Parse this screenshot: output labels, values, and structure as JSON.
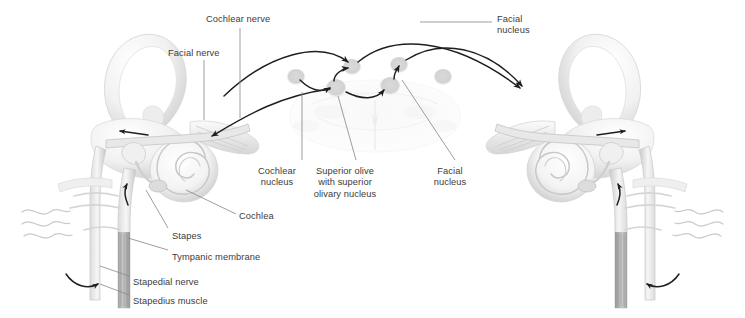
{
  "figure": {
    "background_color": "#ffffff",
    "text_color": "#3b3b3b",
    "leader_line_color": "#8c8c8c",
    "arrow_color": "#1e1e1e",
    "nucleus_node_color": "#d2d2d2",
    "width": 745,
    "height": 318
  },
  "labels": [
    {
      "id": "cochlear-nerve",
      "text": "Cochlear nerve",
      "x": 206,
      "y": 14,
      "align": "left"
    },
    {
      "id": "facial-nerve",
      "text": "Facial nerve",
      "x": 168,
      "y": 48,
      "align": "left"
    },
    {
      "id": "facial-nucleus-top",
      "text": "Facial\nnucleus",
      "x": 497,
      "y": 14,
      "align": "left"
    },
    {
      "id": "cochlear-nucleus",
      "text": "Cochlear\nnucleus",
      "x": 277,
      "y": 166,
      "align": "center"
    },
    {
      "id": "superior-olive",
      "text": "Superior olive\nwith superior\nolivary nucleus",
      "x": 345,
      "y": 166,
      "align": "center"
    },
    {
      "id": "facial-nucleus-mid",
      "text": "Facial\nnucleus",
      "x": 450,
      "y": 166,
      "align": "center"
    },
    {
      "id": "cochlea",
      "text": "Cochlea",
      "x": 239,
      "y": 211,
      "align": "left"
    },
    {
      "id": "stapes",
      "text": "Stapes",
      "x": 172,
      "y": 231,
      "align": "left"
    },
    {
      "id": "tympanic-membrane",
      "text": "Tympanic membrane",
      "x": 172,
      "y": 252,
      "align": "left"
    },
    {
      "id": "stapedial-nerve",
      "text": "Stapedial nerve",
      "x": 133,
      "y": 277,
      "align": "left"
    },
    {
      "id": "stapedius-muscle",
      "text": "Stapedius muscle",
      "x": 133,
      "y": 296,
      "align": "left"
    }
  ],
  "anatomy": {
    "left_ear": "left ear: auricle loop, ossicles, tympanic membrane, cochlear spiral, facial and cochlear nerve trunks, stapedius muscle",
    "right_ear": "right ear: mirrored auricle loop, ossicles, tympanic membrane, cochlear spiral, nerve trunks, stapedius muscle",
    "brainstem": "faint axial brainstem cross-section at center"
  },
  "nuclei_nodes": [
    {
      "id": "left-cochlear-nucleus",
      "x": 336,
      "y": 88
    },
    {
      "id": "left-superior-olive",
      "x": 352,
      "y": 67
    },
    {
      "id": "right-superior-olive",
      "x": 399,
      "y": 65
    },
    {
      "id": "right-facial-nucleus",
      "x": 390,
      "y": 86
    },
    {
      "id": "left-outer-node",
      "x": 296,
      "y": 77
    },
    {
      "id": "right-outer-node",
      "x": 443,
      "y": 77
    }
  ]
}
